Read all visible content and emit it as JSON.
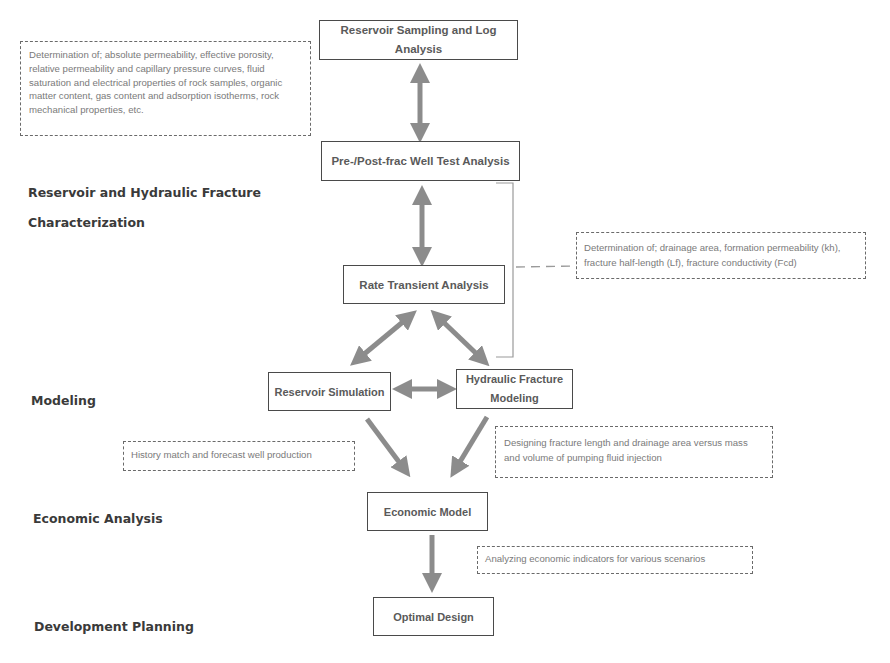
{
  "diagram": {
    "stages": [
      {
        "id": "characterization",
        "label_line1": "Reservoir and Hydraulic Fracture",
        "label_line2": "Characterization"
      },
      {
        "id": "modeling",
        "label": "Modeling"
      },
      {
        "id": "economic",
        "label": "Economic Analysis"
      },
      {
        "id": "development",
        "label": "Development Planning"
      }
    ],
    "boxes": {
      "sampling": {
        "line1": "Reservoir Sampling and Log",
        "line2": "Analysis"
      },
      "well_test": {
        "label": "Pre-/Post-frac Well Test Analysis"
      },
      "rta": {
        "label": "Rate Transient Analysis"
      },
      "res_sim": {
        "label": "Reservoir Simulation"
      },
      "hf_model": {
        "line1": "Hydraulic Fracture",
        "line2": "Modeling"
      },
      "econ_model": {
        "label": "Economic Model"
      },
      "optimal": {
        "label": "Optimal Design"
      }
    },
    "notes": {
      "lab": "Determination of; absolute permeability, effective porosity, relative permeability and capillary pressure curves, fluid saturation and electrical properties of rock samples, organic matter content, gas content and adsorption isotherms, rock mechanical properties, etc.",
      "rta": "Determination of; drainage area, formation permeability (kh), fracture half-length (Lf), fracture conductivity (Fcd)",
      "history": "History match and forecast well production",
      "fracture": "Designing fracture length and drainage area versus mass and volume of pumping fluid injection",
      "economic": "Analyzing economic indicators for various scenarios"
    },
    "colors": {
      "arrow": "#8c8c8c",
      "box_border": "#4a4a4a",
      "box_text": "#5a5a5a",
      "note_text": "#7a7a7a",
      "bracket": "#9a9a9a"
    }
  }
}
